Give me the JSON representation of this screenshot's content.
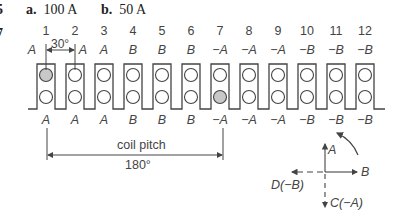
{
  "header": {
    "left_marks": [
      "5",
      "7"
    ],
    "option_a_label": "a.",
    "option_a_value": "100 A",
    "option_b_label": "b.",
    "option_b_value": "50 A"
  },
  "slots": {
    "numbers": [
      "1",
      "2",
      "3",
      "4",
      "5",
      "6",
      "7",
      "8",
      "9",
      "10",
      "11",
      "12"
    ],
    "top_labels": [
      "A",
      "A",
      "A",
      "B",
      "B",
      "B",
      "−A",
      "−A",
      "−A",
      "−B",
      "−B",
      "−B"
    ],
    "bottom_labels": [
      "A",
      "A",
      "A",
      "B",
      "B",
      "B",
      "−A",
      "−A",
      "−A",
      "−B",
      "−B",
      "−B"
    ],
    "shaded": [
      {
        "slot": 1,
        "position": "top"
      },
      {
        "slot": 7,
        "position": "bottom"
      }
    ]
  },
  "dimensions": {
    "slot_angle": "30°",
    "coil_pitch_label": "coil pitch",
    "coil_pitch_angle": "180°"
  },
  "phasor": {
    "up_label": "A",
    "right_label": "B",
    "left_label": "D(−B)",
    "down_label": "C(−A)"
  },
  "colors": {
    "line": "#444444",
    "shaded_conductor": "#c8c8c8"
  }
}
